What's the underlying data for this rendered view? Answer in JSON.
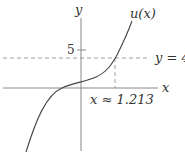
{
  "diagram": {
    "title": "",
    "labels": {
      "y_axis": "y",
      "x_axis": "x",
      "curve": "u(x)",
      "y_tick": "5",
      "horizontal_line": "y = 4",
      "intersection": "x ≈ 1.213"
    },
    "elements": {
      "curve_name": "u(x)",
      "horizontal_line_value": 4,
      "y_tick_value": 5,
      "intersection_x": 1.213
    },
    "colors": {
      "axis": "#888888",
      "curve": "#444444",
      "dashed": "#888888",
      "text": "#333333"
    }
  }
}
